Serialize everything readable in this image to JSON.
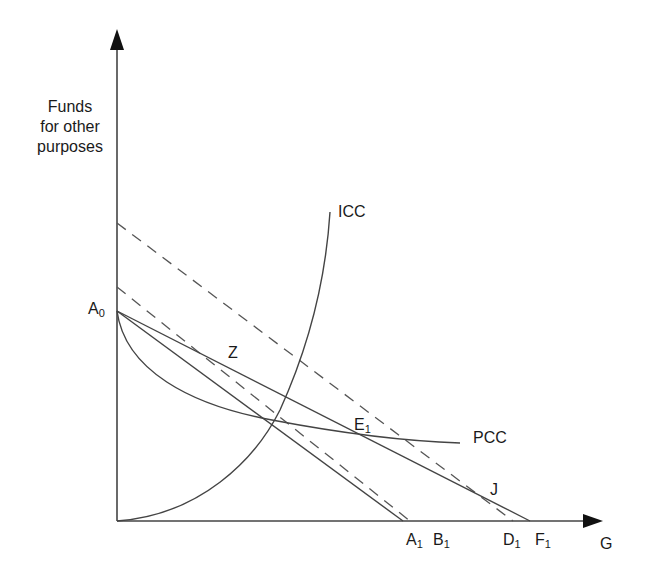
{
  "diagram": {
    "type": "economics-indifference-diagram",
    "y_axis": {
      "label_lines": [
        "Funds",
        "for other",
        "purposes"
      ]
    },
    "x_axis": {
      "label": "G"
    },
    "curves": {
      "icc": {
        "label": "ICC"
      },
      "pcc": {
        "label": "PCC"
      }
    },
    "points": {
      "a0": {
        "base": "A",
        "sub": "0"
      },
      "z": {
        "base": "Z",
        "sub": ""
      },
      "e1": {
        "base": "E",
        "sub": "1"
      },
      "j": {
        "base": "J",
        "sub": ""
      },
      "a1": {
        "base": "A",
        "sub": "1"
      },
      "b1": {
        "base": "B",
        "sub": "1"
      },
      "d1": {
        "base": "D",
        "sub": "1"
      },
      "f1": {
        "base": "F",
        "sub": "1"
      }
    },
    "lines": [
      {
        "name": "budget-line-A0-A1",
        "style": "solid",
        "from": "A0",
        "to": "A1"
      },
      {
        "name": "budget-line-A0-F1",
        "style": "solid",
        "from": "A0",
        "to": "F1"
      },
      {
        "name": "compensated-line-B1",
        "style": "dashed",
        "to": "B1"
      },
      {
        "name": "compensated-line-D1",
        "style": "dashed",
        "to": "D1"
      }
    ],
    "colors": {
      "ink": "#3a3a3a",
      "background": "#ffffff"
    }
  }
}
